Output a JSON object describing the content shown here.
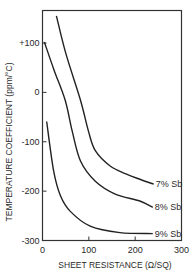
{
  "chart_data": {
    "type": "line",
    "title": "",
    "xlabel": "SHEET RESISTANCE (Ω/SQ)",
    "ylabel": "TEMPERATURE COEFFICIENT (ppm/°C)",
    "xlim": [
      0,
      300
    ],
    "ylim": [
      -300,
      160
    ],
    "x_ticks": [
      0,
      100,
      200,
      300
    ],
    "x_tick_labels": [
      "0",
      "100",
      "200",
      "300"
    ],
    "y_ticks": [
      100,
      0,
      -100,
      -200,
      -300
    ],
    "y_tick_labels": [
      "+100",
      "0",
      "-100",
      "-200",
      "-300"
    ],
    "grid": false,
    "legend": "inline labels at curve ends",
    "series": [
      {
        "name": "7% Sb",
        "points": [
          [
            30,
            155
          ],
          [
            50,
            80
          ],
          [
            82,
            -16
          ],
          [
            99,
            -78
          ],
          [
            114,
            -118
          ],
          [
            146,
            -149
          ],
          [
            180,
            -165
          ],
          [
            210,
            -176
          ],
          [
            240,
            -186
          ]
        ]
      },
      {
        "name": "8% Sb",
        "points": [
          [
            4,
            102
          ],
          [
            25,
            45
          ],
          [
            49,
            -16
          ],
          [
            64,
            -78
          ],
          [
            82,
            -139
          ],
          [
            114,
            -180
          ],
          [
            157,
            -206
          ],
          [
            210,
            -220
          ],
          [
            238,
            -233
          ]
        ]
      },
      {
        "name": "9% Sb",
        "points": [
          [
            9,
            -59
          ],
          [
            24,
            -159
          ],
          [
            39,
            -210
          ],
          [
            60,
            -241
          ],
          [
            103,
            -271
          ],
          [
            167,
            -284
          ],
          [
            238,
            -286
          ]
        ]
      }
    ]
  },
  "labels": {
    "series_7": "7% Sb",
    "series_8": "8% Sb",
    "series_9": "9% Sb"
  }
}
